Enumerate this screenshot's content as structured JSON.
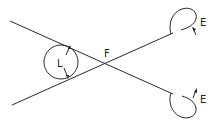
{
  "diagram": {
    "labels": {
      "circle_dimension": "L",
      "intersection": "F",
      "upper_loop": "E",
      "lower_loop": "E"
    },
    "colors": {
      "stroke": "#2a2a2a",
      "background": "#ffffff"
    }
  }
}
